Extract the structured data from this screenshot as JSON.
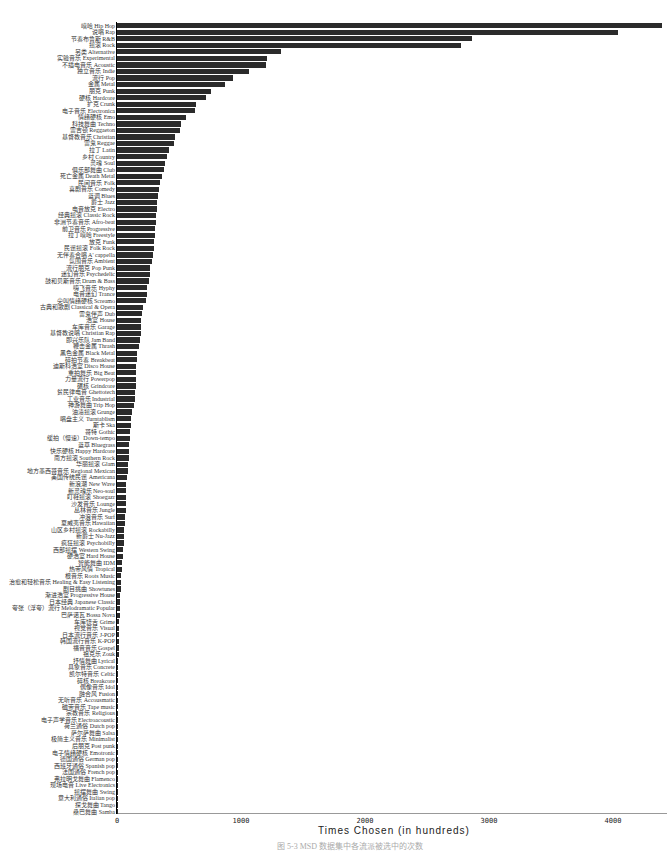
{
  "chart_data": {
    "type": "bar",
    "orientation": "horizontal",
    "title": "",
    "xlabel": "Times Chosen (in hundreds)",
    "ylabel": "",
    "xlim": [
      0,
      4400
    ],
    "xticks": [
      0,
      1000,
      2000,
      3000,
      4000
    ],
    "grid": false,
    "legend": null,
    "bar_color": "#2b2b2b",
    "categories": [
      "嘻哈 Hip Hop",
      "说唱 Rap",
      "节奏布鲁斯 R&B",
      "摇滚 Rock",
      "另类 Alternative",
      "实验音乐 Experimental",
      "不插电音乐 Acoustic",
      "独立音乐 Indie",
      "流行 Pop",
      "金属 Metal",
      "朋克 Punk",
      "硬核 Hardcore",
      "扩克 Crunk",
      "电子音乐 Electronica",
      "情绪硬核 Emo",
      "科技舞曲 Techno",
      "雷吉顿 Reggaeton",
      "基督教音乐 Christian",
      "雷鬼 Reggae",
      "拉丁 Latin",
      "乡村 Country",
      "灵魂 Soul",
      "俱乐部舞曲 Club",
      "死亡金属 Death Metal",
      "民间音乐 Folk",
      "喜剧音乐 Comedy",
      "蓝调 Blues",
      "爵士 Jazz",
      "电音放克 Electro",
      "经典摇滚 Classic Rock",
      "非洲节奏音乐 Afro-beat",
      "前卫音乐 Progressive",
      "拉丁嘻哈 Freestyle",
      "放克 Funk",
      "民谣摇滚 Folk Rock",
      "无伴奏合唱 A' cappella",
      "氛围音乐 Ambient",
      "流行朋克 Pop Punk",
      "迷幻音乐 Psychedelic",
      "鼓和贝斯音乐 Drum & Bass",
      "嗨飞音乐 Hyphy",
      "电音迷幻 Trance",
      "尖叫情绪硬核 Screamo",
      "古典和歌剧 Classical & Opera",
      "雷鬼伴声 Dub",
      "浩室 House",
      "车库音乐 Garage",
      "基督教说唱 Christian Rap",
      "即兴乐队 Jam Band",
      "鞭击金属 Thrash",
      "黑色金属 Black Metal",
      "碎拍节奏 Breakbeat",
      "迪斯科浩室 Disco House",
      "重拍舞乐 Big Beat",
      "力量流行 Powerpop",
      "碾核 Grindcore",
      "贫民律电音 Ghettotech",
      "工业音乐 Industrial",
      "神游舞曲 Trip Hop",
      "油渍摇滚 Grunge",
      "唱盘主义 Turntablism",
      "斯卡 Ska",
      "哥特 Gothic",
      "缓拍（慢速）Down-tempo",
      "蓝草 Bluegrass",
      "快乐硬核 Happy Hardcore",
      "南方摇滚 Southern Rock",
      "华丽摇滚 Glam",
      "地方墨西哥音乐 Regional Mexican",
      "美国传统民谣 Americana",
      "新浪潮 New Wave",
      "新灵魂乐 Neo-soul",
      "盯鞋摇滚 Shoegazr",
      "沙发音乐 Lounge",
      "丛林音乐 Jungle",
      "冲浪音乐 Surf",
      "夏威夷音乐 Hawaiian",
      "山区乡村摇滚 Rockabilly",
      "新爵士 Nu-Jazz",
      "疯狂摇滚 Psychobilly",
      "西部摇摆 Western Swing",
      "硬浩室 Hard House",
      "智能舞曲 IDM",
      "热带风情 Tropical",
      "根音乐 Roots Music",
      "治愈和轻松音乐 Healing & Easy Listening",
      "剧目挑曲 Showtunes",
      "渐进浩室 Progressive House",
      "日本经典 Japanese Classic",
      "夸张（浮夸）流行 Melodramatic Popular",
      "巴萨诺瓦 Bossa Nova",
      "车库饶舌 Grime",
      "视觉音乐 Visual",
      "日本流行音乐 J-POP",
      "韩国流行音乐 K-POP",
      "福音音乐 Gospel",
      "祖克乐 Zouk",
      "抒情舞曲 Lyrical",
      "具象音乐 Concrete",
      "凯尔特音乐 Celtic",
      "碎核 Breakcore",
      "偶像音乐 Idol",
      "融合风 Fusion",
      "无听音乐 Accousmatic",
      "磁带音乐 Tape music",
      "宗教音乐 Religious",
      "电子声学音乐 Electroacoustic",
      "荷兰通俗 Dutch pop",
      "萨尔萨舞曲 Salsa",
      "极简主义音乐 Minimalist",
      "后朋克 Post punk",
      "电子情绪硬核 Emotronic",
      "德国通俗 German pop",
      "西班牙通俗 Spanish pop",
      "法国通俗 French pop",
      "弗拉明戈舞曲 Flamenco",
      "现场电音 Live Electronics",
      "摇摆舞曲 Swing",
      "意大利通俗 Italian pop",
      "探戈舞曲 Tango",
      "桑巴舞曲 Samba"
    ],
    "values": [
      4395,
      4040,
      2865,
      2775,
      1325,
      1210,
      1200,
      1065,
      935,
      870,
      760,
      720,
      640,
      630,
      560,
      520,
      510,
      470,
      460,
      420,
      400,
      385,
      380,
      360,
      345,
      335,
      330,
      325,
      320,
      315,
      315,
      310,
      305,
      300,
      295,
      290,
      285,
      270,
      265,
      255,
      245,
      245,
      230,
      210,
      205,
      195,
      190,
      190,
      185,
      180,
      165,
      160,
      155,
      155,
      150,
      150,
      145,
      145,
      140,
      120,
      115,
      110,
      105,
      105,
      100,
      100,
      95,
      90,
      85,
      80,
      75,
      75,
      75,
      70,
      70,
      65,
      65,
      60,
      60,
      55,
      50,
      45,
      40,
      40,
      35,
      32,
      30,
      28,
      26,
      24,
      22,
      20,
      18,
      16,
      15,
      14,
      13,
      12,
      11,
      10,
      9,
      8,
      7,
      6,
      6,
      5,
      5,
      4,
      4,
      3,
      3,
      3,
      2,
      2,
      2,
      2,
      1,
      1,
      1,
      1,
      1
    ]
  },
  "caption": "图 5-3  MSD 数据集中各流派被选中的次数"
}
